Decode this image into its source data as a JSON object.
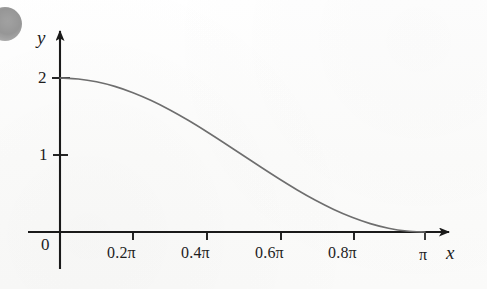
{
  "figure": {
    "background_color": "#fdfdfc",
    "axis_color": "#1a1a1a",
    "curve_color": "#6e6e6e",
    "text_color": "#1d1d1d",
    "blob_color": "#949494"
  },
  "axes": {
    "x_axis_label": "x",
    "y_axis_label": "y",
    "origin_label": "0"
  },
  "x_ticks": [
    {
      "label": "0.2π",
      "value": 0.2
    },
    {
      "label": "0.4π",
      "value": 0.4
    },
    {
      "label": "0.6π",
      "value": 0.6
    },
    {
      "label": "0.8π",
      "value": 0.8
    },
    {
      "label": "π",
      "value": 1.0
    }
  ],
  "y_ticks": [
    {
      "label": "1",
      "value": 1
    },
    {
      "label": "2",
      "value": 2
    }
  ],
  "chart_data": {
    "type": "line",
    "title": "",
    "subtitle": "",
    "xlabel": "x",
    "ylabel": "y",
    "xlim": [
      0,
      3.14159265
    ],
    "ylim": [
      0,
      2.2
    ],
    "xlim_units": "radians",
    "x_tick_values": [
      0.62832,
      1.25664,
      1.88496,
      2.51327,
      3.14159
    ],
    "x_tick_labels": [
      "0.2π",
      "0.4π",
      "0.6π",
      "0.8π",
      "π"
    ],
    "y_tick_values": [
      1,
      2
    ],
    "y_tick_labels": [
      "1",
      "2"
    ],
    "grid": false,
    "legend": null,
    "annotations": [],
    "series": [
      {
        "name": "y = 1 + cos(x)",
        "expression": "1 + cos(x)",
        "color": "#6e6e6e",
        "linewidth": 1.6,
        "x": [
          0.0,
          0.15708,
          0.31416,
          0.47124,
          0.62832,
          0.7854,
          0.94248,
          1.09956,
          1.25664,
          1.41372,
          1.5708,
          1.72788,
          1.88496,
          2.04204,
          2.19911,
          2.35619,
          2.51327,
          2.67035,
          2.82743,
          2.98451,
          3.14159
        ],
        "y": [
          2.0,
          1.9877,
          1.9511,
          1.891,
          1.809,
          1.7071,
          1.5878,
          1.454,
          1.309,
          1.1564,
          1.0,
          0.8436,
          0.691,
          0.546,
          0.4122,
          0.2929,
          0.191,
          0.109,
          0.0489,
          0.0123,
          0.0
        ]
      }
    ]
  }
}
